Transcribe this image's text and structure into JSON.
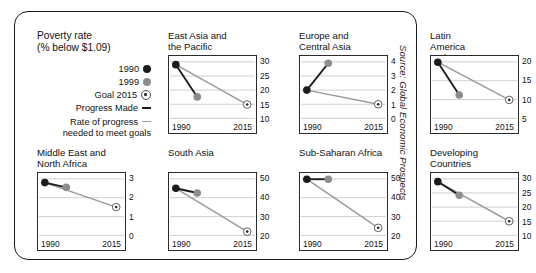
{
  "legend": {
    "title": "Poverty rate\n(% below $1.09)",
    "items": [
      {
        "label": "1990",
        "marker": "filled-black-circle"
      },
      {
        "label": "1999",
        "marker": "filled-gray-circle"
      },
      {
        "label": "Goal 2015",
        "marker": "target-circle"
      },
      {
        "label": "Progress Made",
        "marker": "dark-line"
      },
      {
        "label": "Rate of progress",
        "marker": "gray-line"
      }
    ],
    "sub_label": "needed to meet goals"
  },
  "source": "Source: Global Economic Prospects",
  "axis": {
    "x_start": "1990",
    "x_end": "2015"
  },
  "chart_data": {
    "type": "line",
    "title": "Poverty rate (% below $1.09)",
    "xlabel": "",
    "ylabel": "Poverty rate (% below $1.09)",
    "grid": true,
    "legend_position": "left-panel",
    "x": [
      "1990",
      "1999",
      "2015"
    ],
    "series_names": [
      "Progress Made",
      "Rate of progress needed to meet goals"
    ],
    "panels": [
      {
        "name": "East Asia and\nthe Pacific",
        "ylim": [
          10,
          30
        ],
        "yticks": [
          10,
          15,
          20,
          25,
          30
        ],
        "v1990": 29.0,
        "v1999": 17.6,
        "goal2015": 14.9
      },
      {
        "name": "Europe and\nCentral Asia",
        "ylim": [
          0,
          4
        ],
        "yticks": [
          0,
          1,
          2,
          3,
          4
        ],
        "v1990": 2.0,
        "v1999": 3.9,
        "goal2015": 1.0
      },
      {
        "name": "Latin America and\nthe Caribbean",
        "ylim": [
          5,
          20
        ],
        "yticks": [
          5,
          10,
          15,
          20
        ],
        "v1990": 19.9,
        "v1999": 11.2,
        "goal2015": 9.9
      },
      {
        "name": "Middle East and\nNorth Africa",
        "ylim": [
          0,
          3
        ],
        "yticks": [
          0,
          1,
          2,
          3
        ],
        "v1990": 2.8,
        "v1999": 2.55,
        "goal2015": 1.5
      },
      {
        "name": "South Asia",
        "ylim": [
          20,
          50
        ],
        "yticks": [
          20,
          30,
          40,
          50
        ],
        "v1990": 45.0,
        "v1999": 42.5,
        "goal2015": 22.0
      },
      {
        "name": "Sub-Saharan Africa",
        "ylim": [
          20,
          50
        ],
        "yticks": [
          20,
          30,
          40,
          50
        ],
        "v1990": 49.8,
        "v1999": 49.8,
        "goal2015": 24.0
      },
      {
        "name": "Developing Countries",
        "ylim": [
          10,
          30
        ],
        "yticks": [
          10,
          15,
          20,
          25,
          30
        ],
        "v1990": 29.0,
        "v1999": 24.2,
        "goal2015": 15.0
      }
    ]
  },
  "colors": {
    "marker_1990": "#1b1b1b",
    "marker_1999": "#8d8d8d",
    "progress_line": "#1b1b1b",
    "rate_line": "#9a9a9a",
    "grid": "#b9b9b9",
    "border": "#2b2b2b"
  }
}
